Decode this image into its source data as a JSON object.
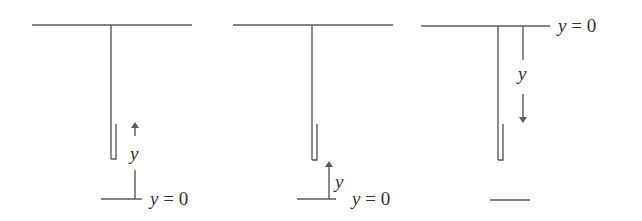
{
  "diagram": {
    "type": "physics-setup",
    "panels": [
      {
        "id": "panel-1",
        "origin": "below",
        "axis_direction": "up",
        "axis_label": "y",
        "origin_label": "y = 0"
      },
      {
        "id": "panel-2",
        "origin": "below",
        "axis_direction": "up",
        "axis_label": "y",
        "origin_label": "y = 0"
      },
      {
        "id": "panel-3",
        "origin": "ceiling",
        "axis_direction": "down",
        "axis_label": "y",
        "origin_label": "y = 0"
      }
    ]
  },
  "colors": {
    "line": "#5a5a5a",
    "text": "#333333",
    "background": "#ffffff"
  }
}
